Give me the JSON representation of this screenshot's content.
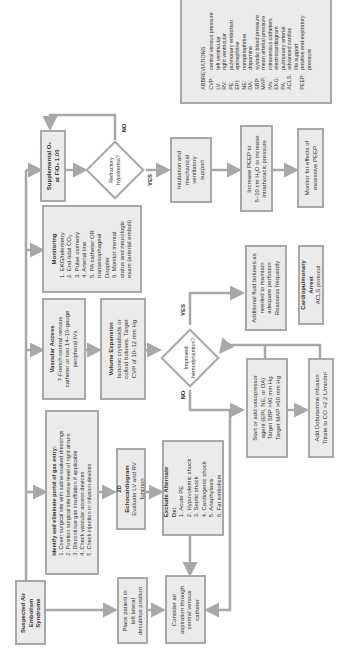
{
  "flowchart": {
    "start": {
      "label": [
        "Suspected Air",
        "Embolism",
        "Syndrome"
      ]
    },
    "identify_portal": {
      "title": "Identify and eliminate portal of gas entry:",
      "items": [
        "1. Cover surgical site with saline-soaked dressings",
        "2. Position surgical site below level of right atrium",
        "3. Discontinue gas insufflation if applicable",
        "4. Check vascular access devices",
        "5. Check injection or infusion devices"
      ]
    },
    "monitoring": {
      "title": "Monitoring",
      "items": [
        "1. EKG/telemetry",
        "2. End-tidal CO₂",
        "3. Pulse oximetry",
        "4. Arterial line",
        "5. PA catheter OR",
        "transesophageal",
        "Doppler",
        "6. Monitor mental",
        "status and neurologic",
        "exam (arterial emboli)"
      ]
    },
    "vascular_access": {
      "title": "Vascular Access",
      "lines": [
        "7-French central venous",
        "catheter or two 14–16-gauge",
        "peripheral IVs"
      ]
    },
    "volume_expansion": {
      "title": "Volume Expansion",
      "lines": [
        "Isotonic crystalloids or",
        "colloid boluses. Target",
        "CVP of 10–12 mm Hg"
      ]
    },
    "supplemental_o2": {
      "lines": [
        "Supplemental O₂",
        "at FiO₂ 1.00"
      ]
    },
    "refractory_hypoxemia": {
      "lines": [
        "Refractory",
        "hypoxemia?"
      ],
      "yes": "YES",
      "no": "NO"
    },
    "intubation": {
      "lines": [
        "Intubation and",
        "mechanical",
        "ventilatory",
        "support"
      ]
    },
    "increase_peep": {
      "lines": [
        "Increase PEEP to",
        "5–10 cm H₂O to increase",
        "intrathoracic pressure"
      ]
    },
    "monitor_peep": {
      "lines": [
        "Monitor for effects of",
        "excessive PEEP"
      ]
    },
    "improved_hemodynamics": {
      "lines": [
        "Improved",
        "hemodynamics?"
      ],
      "yes": "YES",
      "no": "NO"
    },
    "additional_fluid": {
      "lines": [
        "Additional fluid boluses as",
        "needed to maintain",
        "adequate perfusion",
        "Reassess frequently"
      ]
    },
    "cardiopulmonary_arrest": {
      "title": "Cardiopulmonary Arrest",
      "lines": [
        "ACLS protocol"
      ]
    },
    "vasopressor": {
      "lines": [
        "Start or add vasopressor",
        "agent (EPI, NE, or DA)",
        "Target SBP >90 mm Hg",
        "Target MAP >60 mm Hg"
      ]
    },
    "dobutamine": {
      "lines": [
        "Add Dobutamine infusion",
        "Titrate to CO >2.2 L/min/m²"
      ]
    },
    "echo": {
      "title": "2D Echocardiogram",
      "lines": [
        "Evaluate LV and RV",
        "function"
      ]
    },
    "exclude_alternate": {
      "title": "Exclude Alternate Dx:",
      "items": [
        "1. Acute PE",
        "2. Hypovolemic shock",
        "3. Septic shock",
        "4. Cardiogenic shock",
        "5. Anaphylaxis",
        "6. Fat embolism"
      ]
    },
    "left_lateral": {
      "lines": [
        "Place patient in",
        "left lateral",
        "decubitus position"
      ]
    },
    "consider_aspiration": {
      "lines": [
        "Consider air",
        "aspiration through",
        "central venous",
        "catheter"
      ]
    }
  },
  "abbreviations": {
    "title": "ABBREVIATIONS",
    "entries": [
      {
        "k": "CVP:",
        "v": "central venous pressure"
      },
      {
        "k": "LV:",
        "v": "left ventricular"
      },
      {
        "k": "RV:",
        "v": "right ventricular"
      },
      {
        "k": "PE:",
        "v": "pulmonary embolism"
      },
      {
        "k": "EPI:",
        "v": "epinephrine"
      },
      {
        "k": "NE:",
        "v": "norepinephrine"
      },
      {
        "k": "DA:",
        "v": "dopamine"
      },
      {
        "k": "SBP:",
        "v": "systolic blood pressure"
      },
      {
        "k": "MAP:",
        "v": "mean arterial pressure"
      },
      {
        "k": "IVs:",
        "v": "intravenous catheters"
      },
      {
        "k": "EKG:",
        "v": "electrocardiogram"
      },
      {
        "k": "PA:",
        "v": "pulmonary arterial"
      },
      {
        "k": "ACLS:",
        "v": "advanced cardiac"
      },
      {
        "k": "",
        "v": "life support"
      },
      {
        "k": "PEEP:",
        "v": "positive end-expiratory"
      },
      {
        "k": "",
        "v": "pressure"
      }
    ]
  },
  "colors": {
    "box_fill": "#ebebeb",
    "box_border": "#a8a8a8",
    "arrow": "#a8a8a8",
    "text": "#333333"
  }
}
